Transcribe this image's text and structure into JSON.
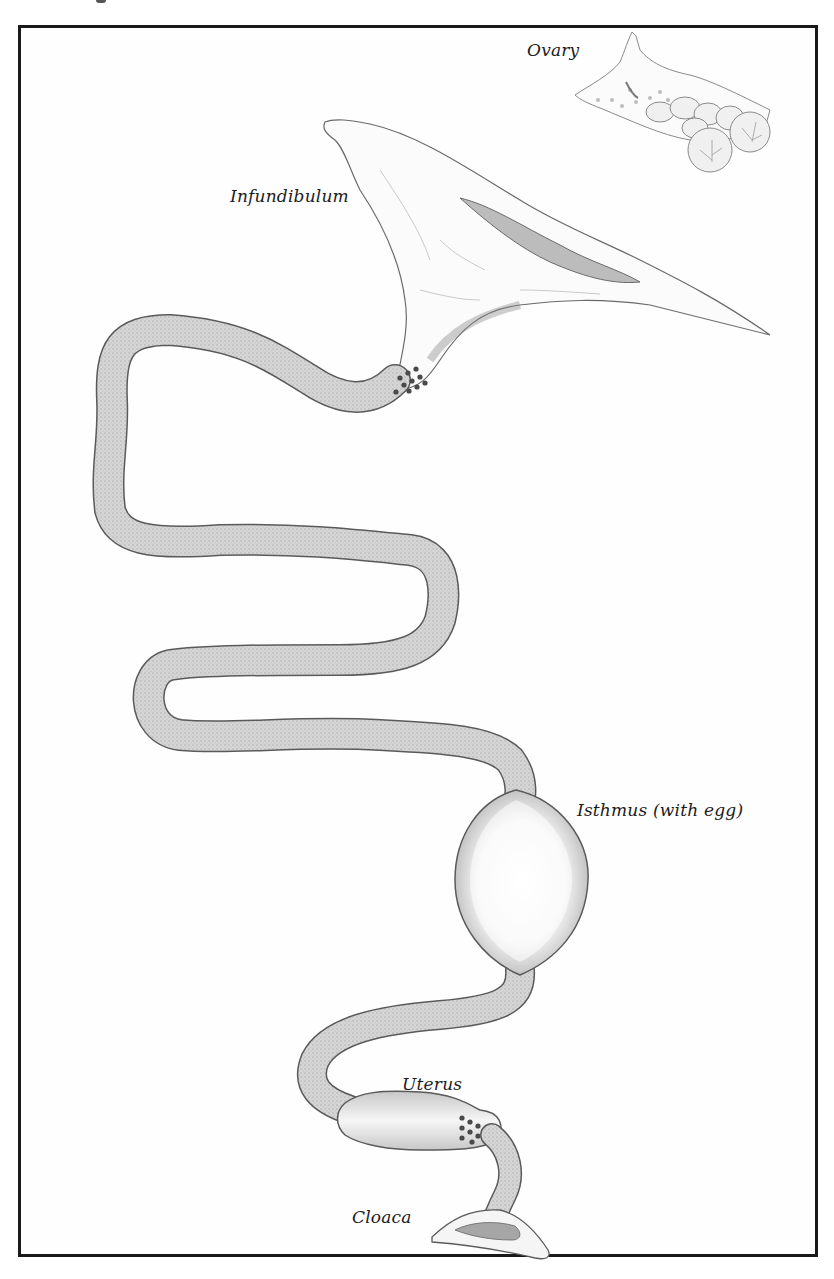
{
  "figure": {
    "labels": {
      "ovary": "Ovary",
      "infundibulum": "Infundibulum",
      "isthmus": "Isthmus (with egg)",
      "uterus": "Uterus",
      "cloaca": "Cloaca"
    },
    "colors": {
      "frame": "#1a1a1a",
      "tube_fill": "#cfcfcf",
      "tube_outline": "#555555",
      "dots": "#4a4a4a",
      "text": "#1c1c1c"
    }
  }
}
